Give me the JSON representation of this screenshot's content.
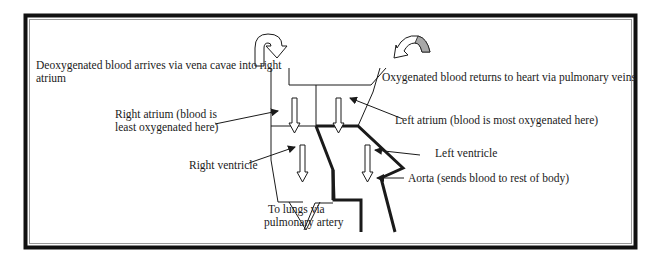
{
  "diagram": {
    "colors": {
      "frame": "#111111",
      "frame_inner": "#9a9a9a",
      "line": "#1a1a1a",
      "arrow_fill": "#ffffff",
      "gray_arrow": "#a8a8a8",
      "background": "#ffffff"
    },
    "labels": {
      "vena_cavae_line1": "Deoxygenated blood arrives via vena cavae into right",
      "vena_cavae_line2": "atrium",
      "pulmonary_veins": "Oxygenated blood returns to heart via pulmonary veins",
      "right_atrium_line1": "Right atrium (blood is",
      "right_atrium_line2": "least oxygenated here)",
      "left_atrium": "Left atrium (blood is most oxygenated here)",
      "right_ventricle": "Right ventricle",
      "left_ventricle": "Left ventricle",
      "aorta": "Aorta (sends blood to rest of body)",
      "pulmonary_artery_line1": "To lungs via",
      "pulmonary_artery_line2": "pulmonary artery"
    }
  }
}
